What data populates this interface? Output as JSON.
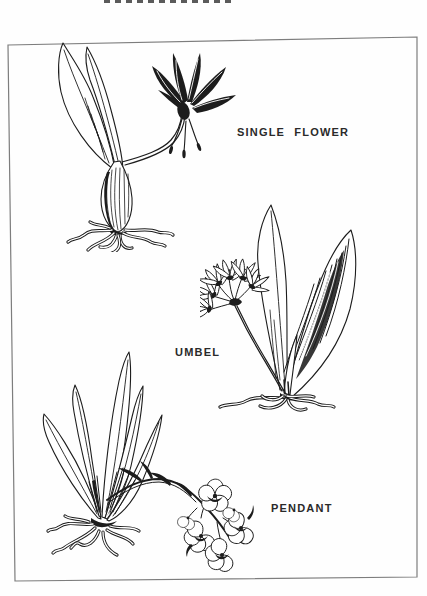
{
  "theme": {
    "paper_color": "#fefefe",
    "ink_color": "#1c1c1c",
    "frame_line_color": "#7d7d7d",
    "label_text_color": "#2a2a2a"
  },
  "figure": {
    "cropped_title_fragment": "illegible letter bottoms cropped at top edge",
    "plants": [
      {
        "id": "single-flower",
        "label": "SINGLE FLOWER",
        "illustration": "bulb with sprawling roots, two lanceolate leaves, curved stalk bearing one nodding flower with recurved petals"
      },
      {
        "id": "umbel",
        "label": "UMBEL",
        "illustration": "two broad upright leaves (one heavily shaded), roots, curving stem topped by an umbel of star-shaped flowers"
      },
      {
        "id": "pendant",
        "label": "PENDANT",
        "illustration": "fan of five narrow leaves with roots and a long arching stem bearing a cluster of drooping ruffled flowers"
      }
    ]
  }
}
